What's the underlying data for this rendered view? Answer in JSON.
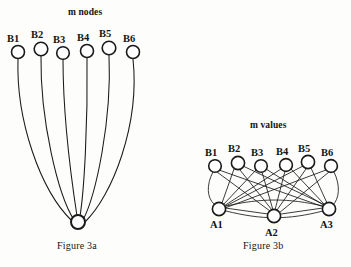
{
  "figure_a": {
    "heading": "m nodes",
    "caption": "Figure 3a",
    "top_nodes": [
      {
        "label": "B1",
        "cx": 18,
        "cy": 52,
        "r": 6.5,
        "label_x": 7,
        "label_y": 34
      },
      {
        "label": "B2",
        "cx": 41,
        "cy": 49,
        "r": 6.8,
        "label_x": 31,
        "label_y": 30
      },
      {
        "label": "B3",
        "cx": 63,
        "cy": 53,
        "r": 6.3,
        "label_x": 53,
        "label_y": 35
      },
      {
        "label": "B4",
        "cx": 87,
        "cy": 51,
        "r": 6.5,
        "label_x": 77,
        "label_y": 33
      },
      {
        "label": "B5",
        "cx": 109,
        "cy": 48,
        "r": 6.8,
        "label_x": 99,
        "label_y": 29
      },
      {
        "label": "B6",
        "cx": 133,
        "cy": 52,
        "r": 6.5,
        "label_x": 123,
        "label_y": 34
      }
    ],
    "hub_node": {
      "cx": 78,
      "cy": 222,
      "r": 7.0
    },
    "edge_count": 6
  },
  "figure_b": {
    "heading": "m values",
    "caption": "Figure 3b",
    "top_nodes": [
      {
        "label": "B1",
        "cx": 215,
        "cy": 166,
        "r": 6.3,
        "label_x": 205,
        "label_y": 148
      },
      {
        "label": "B2",
        "cx": 238,
        "cy": 163,
        "r": 6.6,
        "label_x": 228,
        "label_y": 144
      },
      {
        "label": "B3",
        "cx": 261,
        "cy": 166,
        "r": 6.3,
        "label_x": 251,
        "label_y": 148
      },
      {
        "label": "B4",
        "cx": 286,
        "cy": 165,
        "r": 6.4,
        "label_x": 276,
        "label_y": 147
      },
      {
        "label": "B5",
        "cx": 308,
        "cy": 162,
        "r": 6.6,
        "label_x": 298,
        "label_y": 144
      },
      {
        "label": "B6",
        "cx": 331,
        "cy": 166,
        "r": 6.4,
        "label_x": 321,
        "label_y": 148
      }
    ],
    "bottom_nodes": [
      {
        "label": "A1",
        "cx": 219,
        "cy": 209,
        "r": 6.6,
        "label_x": 210,
        "label_y": 220
      },
      {
        "label": "A2",
        "cx": 274,
        "cy": 216,
        "r": 6.6,
        "label_x": 265,
        "label_y": 228
      },
      {
        "label": "A3",
        "cx": 329,
        "cy": 209,
        "r": 6.6,
        "label_x": 320,
        "label_y": 220
      }
    ],
    "edge_count": 18,
    "inter_a_edges": 2
  },
  "style": {
    "stroke_color": "#1a1a1a",
    "node_fill": "#ffffff",
    "background": "#fdfdfc"
  }
}
